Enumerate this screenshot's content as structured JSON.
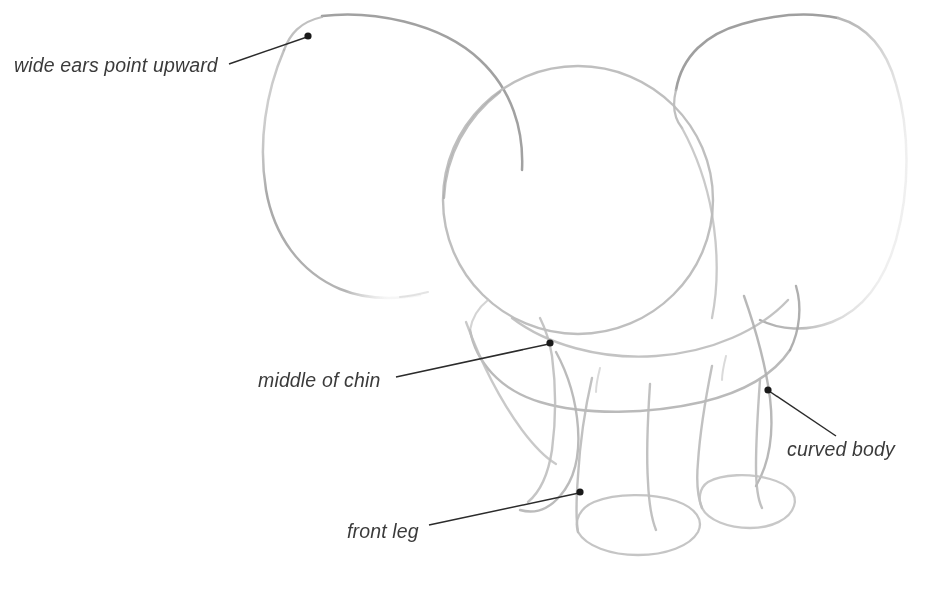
{
  "canvas": {
    "width": 925,
    "height": 593,
    "background": "#ffffff",
    "title": "Elephant sketch construction diagram"
  },
  "style": {
    "sketch_stroke": "#b9b9b9",
    "sketch_stroke_dark": "#9a9a9a",
    "sketch_stroke_light": "#d2d2d2",
    "leader_stroke": "#2b2b2b",
    "dot_fill": "#1a1a1a",
    "label_color": "#3b3b3b",
    "label_font_size": "19.5px",
    "label_font_style": "italic"
  },
  "annotations": [
    {
      "id": "wide-ears",
      "label": "wide ears point upward",
      "label_x": 14,
      "label_y": 72,
      "dot_x": 308,
      "dot_y": 36,
      "line_from_x": 229,
      "line_from_y": 64,
      "line_to_x": 307,
      "line_to_y": 37
    },
    {
      "id": "middle-of-chin",
      "label": "middle of chin",
      "label_x": 258,
      "label_y": 387,
      "dot_x": 550,
      "dot_y": 343,
      "line_from_x": 396,
      "line_from_y": 377,
      "line_to_x": 549,
      "line_to_y": 344
    },
    {
      "id": "curved-body",
      "label": "curved body",
      "label_x": 787,
      "label_y": 456,
      "dot_x": 768,
      "dot_y": 390,
      "line_from_x": 836,
      "line_from_y": 436,
      "line_to_x": 769,
      "line_to_y": 391
    },
    {
      "id": "front-leg",
      "label": "front leg",
      "label_x": 347,
      "label_y": 538,
      "dot_x": 580,
      "dot_y": 492,
      "line_from_x": 429,
      "line_from_y": 525,
      "line_to_x": 579,
      "line_to_y": 493
    }
  ],
  "drawing": {
    "subject": "elephant",
    "view": "front three-quarter",
    "parts": [
      {
        "name": "left-ear",
        "description": "large rounded ear arcing up and left from the head"
      },
      {
        "name": "right-ear",
        "description": "large rounded ear arcing up and right from the head"
      },
      {
        "name": "head-circle",
        "description": "construction circle for the head"
      },
      {
        "name": "body-oval",
        "description": "curved body mass behind and below the head"
      },
      {
        "name": "trunk",
        "description": "trunk curving down from middle of chin"
      },
      {
        "name": "front-leg-left",
        "description": "near front leg with elliptical foot"
      },
      {
        "name": "front-leg-right",
        "description": "far front leg with elliptical foot"
      },
      {
        "name": "foot-ellipse-left",
        "description": "elliptical foot base of near leg"
      },
      {
        "name": "foot-ellipse-right",
        "description": "elliptical foot base of far leg"
      }
    ]
  }
}
